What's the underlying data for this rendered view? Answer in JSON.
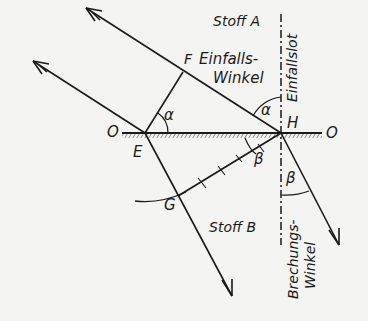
{
  "diagram": {
    "type": "refraction-construction",
    "colors": {
      "ink": "#1a1a1a",
      "paper": "#f4f4f2"
    },
    "media": {
      "upper": "Stoff A",
      "lower": "Stoff B"
    },
    "points": {
      "O_left": "O",
      "O_right": "O",
      "E": "E",
      "F": "F",
      "H": "H",
      "G": "G"
    },
    "angles": {
      "incidence": "α",
      "incidence_at_E": "α",
      "refraction": "β",
      "refraction_at_H": "β"
    },
    "labels": {
      "normal": "Einfallslot",
      "incidence_angle_line1": "Einfalls-",
      "incidence_angle_line2": "Winkel",
      "refraction_angle_line1": "Brechungs-",
      "refraction_angle_line2": "Winkel"
    }
  }
}
